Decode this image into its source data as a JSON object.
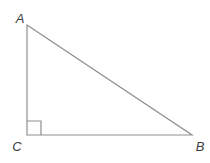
{
  "figure": {
    "width": 210,
    "height": 163,
    "background_color": "#ffffff",
    "stroke_color": "#8f8f8f",
    "label_color": "#3d3d3d",
    "vertices": [
      {
        "name": "A",
        "label": "A",
        "x": 27,
        "y": 25,
        "label_x": 20,
        "label_y": 23
      },
      {
        "name": "B",
        "label": "B",
        "x": 192,
        "y": 135,
        "label_x": 200,
        "label_y": 151
      },
      {
        "name": "C",
        "label": "C",
        "x": 27,
        "y": 135,
        "label_x": 17,
        "label_y": 151
      }
    ],
    "right_angle_marker": {
      "at_vertex": "C",
      "size": 14
    }
  }
}
